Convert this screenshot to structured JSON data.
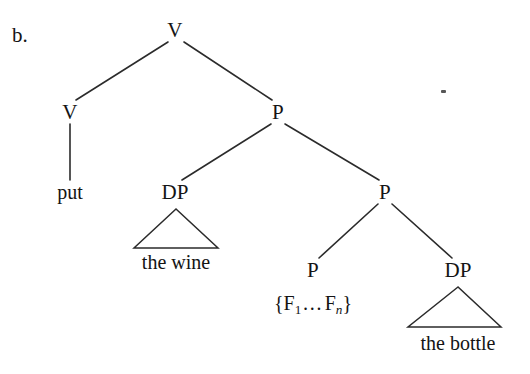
{
  "figure": {
    "item_label": "b.",
    "background_color": "#ffffff",
    "line_color": "#2b2b2b",
    "text_color": "#141414"
  },
  "tree": {
    "nodes": [
      {
        "id": "root-v",
        "label": "V",
        "x": 175,
        "y": 30
      },
      {
        "id": "left-v",
        "label": "V",
        "x": 70,
        "y": 112
      },
      {
        "id": "upper-p",
        "label": "P",
        "x": 278,
        "y": 112
      },
      {
        "id": "wine-dp",
        "label": "DP",
        "x": 175,
        "y": 192
      },
      {
        "id": "middle-p",
        "label": "P",
        "x": 385,
        "y": 192
      },
      {
        "id": "lower-p",
        "label": "P",
        "x": 313,
        "y": 270
      },
      {
        "id": "bottle-dp",
        "label": "DP",
        "x": 458,
        "y": 270
      }
    ],
    "terminals": [
      {
        "id": "put",
        "label": "put",
        "x": 70,
        "y": 192
      },
      {
        "id": "the-wine",
        "label": "the wine",
        "x": 176,
        "y": 262
      },
      {
        "id": "the-bottle",
        "label": "the bottle",
        "x": 458,
        "y": 343
      }
    ],
    "feature_set": {
      "id": "feature-set",
      "prefix": "{F",
      "sub_first": "1",
      "dots": "…",
      "mid": "F",
      "sub_last": "n",
      "suffix": "}",
      "plain_text": "{F1…Fn}",
      "x": 313,
      "y": 303
    }
  }
}
